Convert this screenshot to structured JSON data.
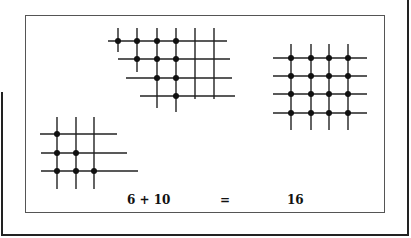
{
  "figure": {
    "equation": {
      "left_term": "6 + 10",
      "equals": "=",
      "result": "16"
    },
    "grids": [
      {
        "name": "top-staircase-grid",
        "rows_y": [
          41,
          59,
          78,
          96
        ],
        "cols_x": [
          118,
          137,
          157,
          176,
          195,
          214
        ],
        "dots_per_row": [
          4,
          3,
          2,
          1
        ],
        "dot_count": 10
      },
      {
        "name": "right-square-grid",
        "rows_y": [
          58,
          76,
          94,
          113
        ],
        "cols_x": [
          291,
          311,
          329,
          348
        ],
        "dot_count": 16
      },
      {
        "name": "bottom-left-staircase-grid",
        "rows_y": [
          134,
          153,
          171
        ],
        "cols_x": [
          57,
          76,
          94
        ],
        "dots_per_row": [
          1,
          2,
          3
        ],
        "dot_count": 6
      }
    ],
    "colors": {
      "ink": "#111111",
      "panel_border": "#555555",
      "background": "#ffffff"
    }
  }
}
